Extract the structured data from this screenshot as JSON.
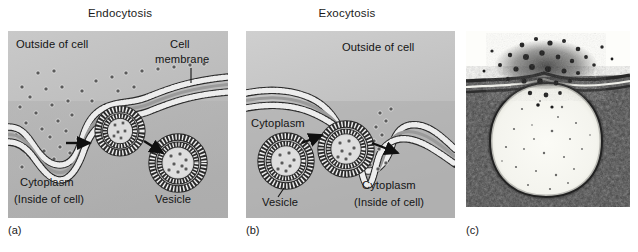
{
  "figure": {
    "panels": [
      {
        "id": "endocytosis",
        "title": "Endocytosis",
        "caption": "(a)",
        "labels": {
          "outside": "Outside of cell",
          "membrane_line1": "Cell",
          "membrane_line2": "membrane",
          "cytoplasm_line1": "Cytoplasm",
          "cytoplasm_line2": "(Inside of cell)",
          "vesicle": "Vesicle"
        }
      },
      {
        "id": "exocytosis",
        "title": "Exocytosis",
        "caption": "(b)",
        "labels": {
          "outside": "Outside of cell",
          "cytoplasm": "Cytoplasm",
          "vesicle": "Vesicle",
          "cytoplasm_lower_line1": "Cytoplasm",
          "cytoplasm_lower_line2": "(Inside of cell)"
        }
      },
      {
        "id": "micrograph",
        "title": "",
        "caption": "(c)",
        "labels": {}
      }
    ]
  },
  "colors": {
    "panel_background": "#b4b4b4",
    "panel_background_light": "#c8c8c8",
    "membrane_fill": "#ededed",
    "membrane_stroke": "#2a2a2a",
    "particle_fill": "#555555",
    "text": "#141414",
    "arrow": "#101010",
    "micrograph_dark": "#2b2b2b",
    "micrograph_light": "#f5f5f0",
    "page_background": "#ffffff"
  }
}
